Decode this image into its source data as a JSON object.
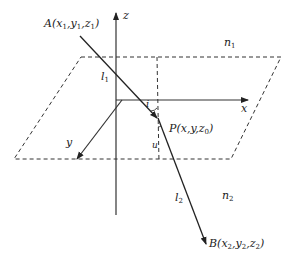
{
  "diagram": {
    "type": "refraction-geometry",
    "axes": {
      "x_label": "x",
      "y_label": "y",
      "z_label": "z"
    },
    "points": {
      "A": {
        "name": "A",
        "coords": [
          "x",
          "y",
          "z"
        ],
        "subscript": "1"
      },
      "P": {
        "name": "P",
        "coords_text": "(x,y,z",
        "z_sub": "0",
        "close": ")"
      },
      "B": {
        "name": "B",
        "subscript": "2"
      }
    },
    "media": {
      "upper": {
        "sym": "n",
        "sub": "1"
      },
      "lower": {
        "sym": "n",
        "sub": "2"
      }
    },
    "rays": {
      "incident": {
        "sym": "l",
        "sub": "1"
      },
      "refracted": {
        "sym": "l",
        "sub": "2"
      }
    },
    "angles": {
      "incidence": "i",
      "refraction": "u"
    },
    "colors": {
      "line": "#222222",
      "background": "#ffffff"
    }
  }
}
